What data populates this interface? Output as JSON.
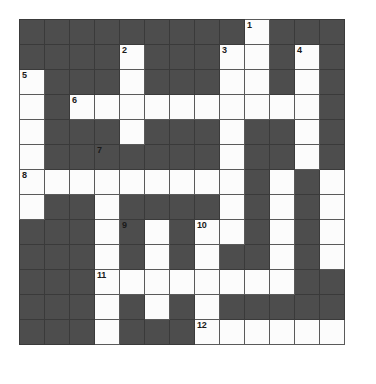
{
  "puzzle": {
    "type": "crossword-grid",
    "rows": 13,
    "cols": 13,
    "colors": {
      "block": "#4d4d4d",
      "open": "#fcfcfc",
      "gridline": "#3a3a3a",
      "number": "#1a1a1a",
      "page_background": "#ffffff"
    },
    "clue_numbers": [
      1,
      2,
      3,
      4,
      5,
      6,
      7,
      8,
      9,
      10,
      11,
      12
    ],
    "number_positions": [
      {
        "number": "1",
        "row": 1,
        "col": 10
      },
      {
        "number": "2",
        "row": 2,
        "col": 5
      },
      {
        "number": "3",
        "row": 2,
        "col": 9
      },
      {
        "number": "4",
        "row": 2,
        "col": 12
      },
      {
        "number": "5",
        "row": 3,
        "col": 1
      },
      {
        "number": "6",
        "row": 4,
        "col": 3
      },
      {
        "number": "7",
        "row": 6,
        "col": 4
      },
      {
        "number": "8",
        "row": 7,
        "col": 1
      },
      {
        "number": "9",
        "row": 9,
        "col": 5
      },
      {
        "number": "10",
        "row": 9,
        "col": 8
      },
      {
        "number": "11",
        "row": 11,
        "col": 4
      },
      {
        "number": "12",
        "row": 13,
        "col": 8
      }
    ],
    "cells": [
      [
        "block",
        "block",
        "block",
        "block",
        "block",
        "block",
        "block",
        "block",
        "block",
        "open",
        "block",
        "block",
        "block"
      ],
      [
        "block",
        "block",
        "block",
        "block",
        "open",
        "block",
        "block",
        "block",
        "open",
        "open",
        "block",
        "open",
        "block"
      ],
      [
        "open",
        "block",
        "block",
        "block",
        "open",
        "block",
        "block",
        "block",
        "open",
        "open",
        "block",
        "open",
        "block"
      ],
      [
        "open",
        "block",
        "open",
        "open",
        "open",
        "open",
        "open",
        "open",
        "open",
        "open",
        "open",
        "open",
        "block"
      ],
      [
        "open",
        "block",
        "block",
        "block",
        "open",
        "block",
        "block",
        "block",
        "open",
        "block",
        "block",
        "open",
        "block"
      ],
      [
        "open",
        "block",
        "block",
        "block",
        "block",
        "block",
        "block",
        "block",
        "open",
        "block",
        "block",
        "open",
        "block"
      ],
      [
        "open",
        "open",
        "open",
        "open",
        "open",
        "open",
        "open",
        "open",
        "open",
        "block",
        "open",
        "block",
        "open"
      ],
      [
        "open",
        "block",
        "block",
        "open",
        "block",
        "block",
        "block",
        "block",
        "open",
        "block",
        "open",
        "block",
        "open"
      ],
      [
        "block",
        "block",
        "block",
        "open",
        "block",
        "open",
        "block",
        "open",
        "open",
        "block",
        "open",
        "block",
        "open"
      ],
      [
        "block",
        "block",
        "block",
        "open",
        "block",
        "open",
        "block",
        "open",
        "block",
        "block",
        "open",
        "block",
        "open"
      ],
      [
        "block",
        "block",
        "block",
        "open",
        "open",
        "open",
        "open",
        "open",
        "open",
        "open",
        "open",
        "block",
        "block"
      ],
      [
        "block",
        "block",
        "block",
        "open",
        "block",
        "open",
        "block",
        "open",
        "block",
        "block",
        "block",
        "block",
        "block"
      ],
      [
        "block",
        "block",
        "block",
        "open",
        "block",
        "block",
        "block",
        "open",
        "open",
        "open",
        "open",
        "open",
        "open"
      ]
    ]
  }
}
